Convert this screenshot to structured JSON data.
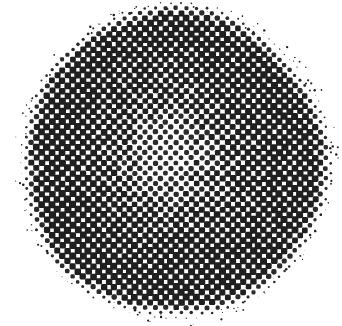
{
  "image": {
    "title": "Halftone dot disk",
    "width": 342,
    "height": 326,
    "background_color": "#ffffff",
    "ink_color": "#1f1f1f",
    "description": "A circular disk rendered as a rotated halftone dot screen on a white background."
  },
  "chart_data": {
    "type": "heatmap",
    "title": "Halftone dot disk",
    "subtitle": "",
    "xlabel": "",
    "ylabel": "",
    "grid": false,
    "legend_position": "none",
    "xlim": [
      0,
      342
    ],
    "ylim": [
      0,
      326
    ],
    "render": {
      "background_color": "#ffffff",
      "ink_color": "#1f1f1f",
      "ink_color_light": "#2b2b2b",
      "dot_shape": "rounded-square",
      "screen_pitch_px": 7.3,
      "screen_angle_deg": 45,
      "grain_amount": 0.14,
      "edge_softness_px": 12
    },
    "disk": {
      "center_x": 176,
      "center_y": 163,
      "radius": 152,
      "bounds": {
        "left": 20,
        "top": 18,
        "right": 330,
        "bottom": 308
      }
    },
    "tone_profile": {
      "description": "Dot area coverage as a function of normalized radius from disk center. Light at the center, darkest at mid-to-outer radius, then falls off to zero past the rim.",
      "radius_normalized": [
        0.0,
        0.1,
        0.2,
        0.3,
        0.4,
        0.5,
        0.6,
        0.7,
        0.8,
        0.88,
        0.94,
        0.98,
        1.0,
        1.04
      ],
      "coverage": [
        0.42,
        0.44,
        0.5,
        0.58,
        0.66,
        0.74,
        0.8,
        0.85,
        0.88,
        0.86,
        0.74,
        0.48,
        0.22,
        0.0
      ]
    },
    "highlight": {
      "description": "Lightest tone region, offset slightly up and left of the geometric center.",
      "center_x": 168,
      "center_y": 156,
      "radius": 34,
      "min_coverage": 0.4
    }
  }
}
